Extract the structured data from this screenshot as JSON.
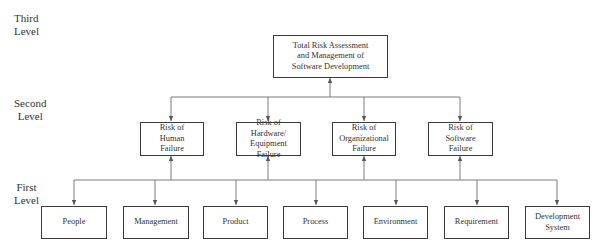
{
  "levels": {
    "third": "Third\nLevel",
    "second": "Second\nLevel",
    "first": "First\nLevel"
  },
  "third_level": {
    "label": "Total Risk Assessment\nand Management of\nSoftware Development"
  },
  "second_level": [
    {
      "label": "Risk of\nHuman\nFailure"
    },
    {
      "label": "Risk of Hardware/\nEquipment\nFailure"
    },
    {
      "label": "Risk of\nOrganizational\nFailure"
    },
    {
      "label": "Risk of\nSoftware\nFailure"
    }
  ],
  "first_level": [
    {
      "label": "People"
    },
    {
      "label": "Management"
    },
    {
      "label": "Product"
    },
    {
      "label": "Process"
    },
    {
      "label": "Environment"
    },
    {
      "label": "Requirement"
    },
    {
      "label": "Development\nSystem"
    }
  ],
  "colors": {
    "box_border": "#3a3a3a",
    "connector": "#7a7a7a",
    "text": "#333333"
  }
}
